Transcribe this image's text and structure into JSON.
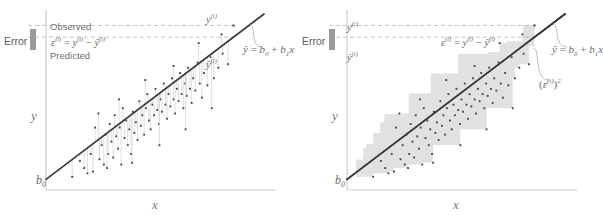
{
  "figure": {
    "title": "",
    "background": "#ffffff",
    "panels": [
      {
        "id": "left",
        "name": "error-panel",
        "caption": "",
        "axis": {
          "xlabel": "x",
          "ylabel": "y",
          "intercept_label": "b0"
        },
        "annotations": {
          "error_label": "Error",
          "observed_label": "Observed",
          "predicted_label": "Predicted",
          "residual_formula_eps": "ε",
          "residual_formula_rest": " = y",
          "observed_point_label": "y",
          "predicted_point_label": "ŷ",
          "line_equation": "ŷ = b",
          "superscript": "(i)"
        }
      },
      {
        "id": "right",
        "name": "squared-error-panel",
        "caption": "",
        "axis": {
          "xlabel": "x",
          "ylabel": "y",
          "intercept_label": "b0"
        },
        "annotations": {
          "error_label": "Error",
          "observed_point_label": "y",
          "predicted_point_label": "ŷ",
          "residual_formula": "ε",
          "squared_error_label": "(ε",
          "line_equation": "ŷ = b",
          "superscript": "(i)"
        }
      }
    ]
  },
  "text": {
    "error": "Error",
    "observed": "Observed",
    "predicted": "Predicted",
    "eps": "ε",
    "y": "y",
    "yhat": "ŷ",
    "sup_i": "(i)",
    "equals": "=",
    "minus": "−",
    "b": "b",
    "sub0": "0",
    "sub1": "1",
    "x": "x",
    "plus": "+",
    "squared": "2",
    "paren_open": "(",
    "paren_close": ")"
  },
  "colors": {
    "axis": "#c9c9c9",
    "regression_line": "#3a3a3a",
    "point": "#4a4a4a",
    "dashed": "#bdbdbd",
    "residual_line": "#d5d5d5",
    "square_fill": "#9d9d9d",
    "error_bar": "#9a9a9a",
    "text": "#6d6d6d",
    "background": "#ffffff"
  },
  "chart_data": {
    "type": "scatter",
    "title": "",
    "xlabel": "x",
    "ylabel": "y",
    "grid": false,
    "legend": null,
    "xlim": [
      0,
      1
    ],
    "ylim": [
      0,
      1
    ],
    "regression_line": {
      "intercept_label": "b0",
      "equation": "yhat = b0 + b1*x",
      "x0": 0.0,
      "y0": 0.06,
      "x1": 1.0,
      "y1": 1.0
    },
    "highlighted_point": {
      "x": 0.86,
      "y": 0.935,
      "observed_label": "y(i)",
      "predicted_label": "yhat(i)"
    },
    "points": [
      [
        0.175,
        0.125
      ],
      [
        0.205,
        0.205
      ],
      [
        0.215,
        0.105
      ],
      [
        0.225,
        0.355
      ],
      [
        0.245,
        0.175
      ],
      [
        0.255,
        0.255
      ],
      [
        0.265,
        0.145
      ],
      [
        0.272,
        0.315
      ],
      [
        0.285,
        0.205
      ],
      [
        0.292,
        0.375
      ],
      [
        0.3,
        0.275
      ],
      [
        0.308,
        0.185
      ],
      [
        0.315,
        0.425
      ],
      [
        0.322,
        0.305
      ],
      [
        0.33,
        0.235
      ],
      [
        0.338,
        0.355
      ],
      [
        0.345,
        0.145
      ],
      [
        0.352,
        0.465
      ],
      [
        0.36,
        0.295
      ],
      [
        0.368,
        0.395
      ],
      [
        0.375,
        0.255
      ],
      [
        0.382,
        0.345
      ],
      [
        0.39,
        0.205
      ],
      [
        0.398,
        0.445
      ],
      [
        0.405,
        0.325
      ],
      [
        0.412,
        0.385
      ],
      [
        0.42,
        0.285
      ],
      [
        0.428,
        0.505
      ],
      [
        0.435,
        0.365
      ],
      [
        0.442,
        0.425
      ],
      [
        0.45,
        0.315
      ],
      [
        0.458,
        0.465
      ],
      [
        0.465,
        0.545
      ],
      [
        0.472,
        0.395
      ],
      [
        0.48,
        0.345
      ],
      [
        0.488,
        0.485
      ],
      [
        0.495,
        0.425
      ],
      [
        0.502,
        0.575
      ],
      [
        0.51,
        0.455
      ],
      [
        0.518,
        0.375
      ],
      [
        0.525,
        0.515
      ],
      [
        0.532,
        0.445
      ],
      [
        0.54,
        0.605
      ],
      [
        0.548,
        0.485
      ],
      [
        0.555,
        0.405
      ],
      [
        0.562,
        0.545
      ],
      [
        0.57,
        0.475
      ],
      [
        0.578,
        0.635
      ],
      [
        0.585,
        0.515
      ],
      [
        0.592,
        0.435
      ],
      [
        0.6,
        0.575
      ],
      [
        0.608,
        0.505
      ],
      [
        0.615,
        0.665
      ],
      [
        0.622,
        0.545
      ],
      [
        0.63,
        0.465
      ],
      [
        0.638,
        0.605
      ],
      [
        0.645,
        0.535
      ],
      [
        0.652,
        0.695
      ],
      [
        0.66,
        0.575
      ],
      [
        0.668,
        0.495
      ],
      [
        0.675,
        0.635
      ],
      [
        0.685,
        0.565
      ],
      [
        0.695,
        0.725
      ],
      [
        0.705,
        0.605
      ],
      [
        0.715,
        0.525
      ],
      [
        0.725,
        0.665
      ],
      [
        0.74,
        0.595
      ],
      [
        0.755,
        0.755
      ],
      [
        0.77,
        0.635
      ],
      [
        0.79,
        0.695
      ],
      [
        0.81,
        0.775
      ],
      [
        0.835,
        0.715
      ],
      [
        0.12,
        0.075
      ],
      [
        0.155,
        0.165
      ],
      [
        0.19,
        0.095
      ],
      [
        0.24,
        0.435
      ],
      [
        0.28,
        0.125
      ],
      [
        0.335,
        0.515
      ],
      [
        0.395,
        0.155
      ],
      [
        0.455,
        0.625
      ],
      [
        0.52,
        0.255
      ],
      [
        0.585,
        0.705
      ],
      [
        0.64,
        0.345
      ],
      [
        0.7,
        0.835
      ],
      [
        0.76,
        0.465
      ],
      [
        0.805,
        0.885
      ]
    ]
  }
}
